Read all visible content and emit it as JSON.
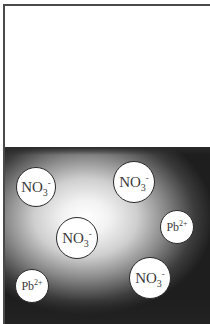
{
  "diagram": {
    "regions": {
      "air": {
        "color": "#ffffff"
      },
      "solution": {
        "color_edge": "#1e1e1e",
        "color_center": "#ffffff"
      }
    },
    "ions": [
      {
        "id": "no3-1",
        "symbol": "NO",
        "subscript": "3",
        "charge": "-",
        "cx": 36,
        "cy": 187,
        "r": 20
      },
      {
        "id": "no3-2",
        "symbol": "NO",
        "subscript": "3",
        "charge": "-",
        "cx": 134,
        "cy": 182,
        "r": 21
      },
      {
        "id": "pb-1",
        "symbol": "Pb",
        "subscript": "",
        "charge": "2+",
        "cx": 177,
        "cy": 227,
        "r": 17
      },
      {
        "id": "no3-3",
        "symbol": "NO",
        "subscript": "3",
        "charge": "-",
        "cx": 77,
        "cy": 238,
        "r": 21
      },
      {
        "id": "pb-2",
        "symbol": "Pb",
        "subscript": "",
        "charge": "2+",
        "cx": 32,
        "cy": 286,
        "r": 17
      },
      {
        "id": "no3-4",
        "symbol": "NO",
        "subscript": "3",
        "charge": "-",
        "cx": 150,
        "cy": 278,
        "r": 21
      }
    ]
  }
}
